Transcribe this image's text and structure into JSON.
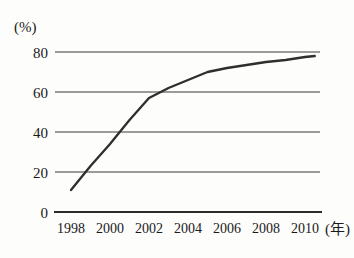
{
  "figure": {
    "background_color": "#fdfdfc",
    "line_color": "#2e2e2e",
    "gridline_color": "#9b9b9b",
    "axis_color": "#2b2b2b"
  },
  "chart_data": {
    "type": "line",
    "title": "",
    "xlabel": "(年)",
    "ylabel": "(%)",
    "xlim": [
      1997,
      2011.5
    ],
    "ylim": [
      0,
      88
    ],
    "grid": true,
    "legend": "none",
    "x_tick_labels": [
      "1998",
      "2000",
      "2002",
      "2004",
      "2006",
      "2008",
      "2010"
    ],
    "x_ticks": [
      1998,
      2000,
      2002,
      2004,
      2006,
      2008,
      2010
    ],
    "y_tick_labels": [
      "0",
      "20",
      "40",
      "60",
      "80"
    ],
    "y_ticks": [
      0,
      20,
      40,
      60,
      80
    ],
    "gridline_values": [
      20,
      40,
      60,
      80
    ],
    "series": [
      {
        "name": "",
        "x": [
          1998,
          1999,
          2000,
          2001,
          2002,
          2003,
          2004,
          2005,
          2006,
          2007,
          2008,
          2009,
          2010,
          2010.5
        ],
        "values": [
          11,
          23,
          34,
          46,
          57,
          62,
          66,
          70,
          72,
          73.5,
          75,
          76,
          77.5,
          78
        ]
      }
    ]
  }
}
